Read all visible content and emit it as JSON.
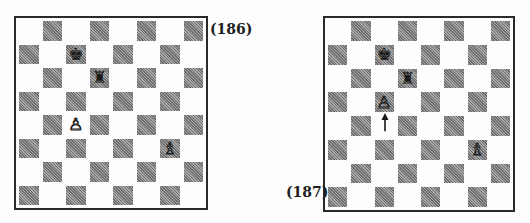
{
  "diagrams": [
    {
      "label": "(186)",
      "position": {
        "c7": {
          "piece": "king",
          "color": "black",
          "glyph": "♚"
        },
        "d6": {
          "piece": "rook",
          "color": "black",
          "glyph": "♜"
        },
        "c4": {
          "piece": "pawn",
          "color": "white",
          "glyph": "♙"
        },
        "g3": {
          "piece": "bishop",
          "color": "white",
          "glyph": "♗"
        }
      }
    },
    {
      "label": "(187)",
      "position": {
        "c7": {
          "piece": "king",
          "color": "black",
          "glyph": "♚"
        },
        "d6": {
          "piece": "rook",
          "color": "black",
          "glyph": "♜"
        },
        "c5": {
          "piece": "pawn",
          "color": "white",
          "glyph": "♙"
        },
        "g3": {
          "piece": "bishop",
          "color": "white",
          "glyph": "♗"
        }
      },
      "arrow": {
        "from": "c4",
        "to": "c5",
        "icon": "arrow-up-icon"
      }
    }
  ],
  "colors": {
    "border": "#2a2a2a",
    "light_square": "#fdfdfd",
    "dark_square": "#8a8a8a"
  }
}
